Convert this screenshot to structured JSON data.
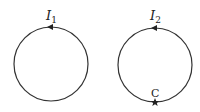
{
  "loops": [
    {
      "label_main": "I",
      "label_sub": "1",
      "cx": 51,
      "cy": 64,
      "r": 37
    },
    {
      "label_main": "I",
      "label_sub": "2",
      "cx": 155,
      "cy": 65,
      "r": 37,
      "point_label": "C"
    }
  ],
  "colors": {
    "stroke": "#333333"
  }
}
